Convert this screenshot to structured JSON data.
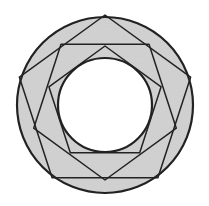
{
  "diagram": {
    "title": "",
    "canvas": {
      "width": 209,
      "height": 206
    },
    "center": {
      "x": 105,
      "y": 105
    },
    "colors": {
      "background": "#ffffff",
      "ring_fill": "#d4d4d4",
      "stroke": "#222222"
    },
    "outer_circle": {
      "r": 88,
      "stroke_width": 2.2
    },
    "inner_circle": {
      "r": 47,
      "stroke_width": 2.2
    },
    "polygons": [
      {
        "name": "outer-upright-pentagon",
        "points": "105,15 190.6,77.2 157.9,177.8 52.1,177.8 19.4,77.2",
        "stroke_width": 1.5
      },
      {
        "name": "inverted-pentagon",
        "points": "61,44.3 149,44.3 176.3,128.2 105,180 33.7,128.2",
        "stroke_width": 1.5
      },
      {
        "name": "inner-upright-pentagon",
        "points": "105,46 161.1,86.8 139.7,152.7 70.3,152.7 48.9,86.8",
        "stroke_width": 1.5
      }
    ]
  }
}
